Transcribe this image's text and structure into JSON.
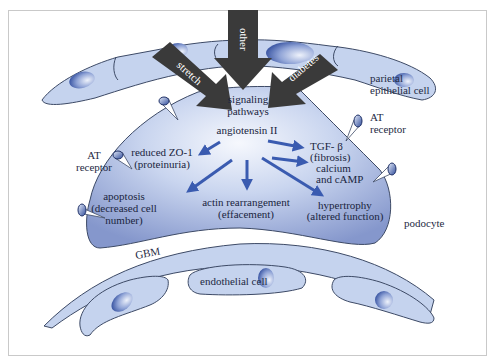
{
  "diagram": {
    "type": "biological-pathway-schematic",
    "colors": {
      "cell_fill": "#c5d3ee",
      "cell_stroke": "#3d4a66",
      "podocyte_center": "#f4f7fd",
      "podocyte_edge": "#8ea3d4",
      "input_arrow": "#3a3a3a",
      "effect_arrow": "#3a5bb0",
      "text": "#1e2a44"
    },
    "inputs": [
      {
        "label": "stretch"
      },
      {
        "label": "other"
      },
      {
        "label": "diabetes"
      }
    ],
    "cells": {
      "parietal": {
        "line1": "parietal",
        "line2": "epithelial cell"
      },
      "podocyte": {
        "label": "podocyte"
      },
      "gbm": {
        "label": "GBM"
      },
      "endothelial": {
        "label": "endothelial cell"
      }
    },
    "receptors": {
      "left": {
        "line1": "AT",
        "line2": "receptor"
      },
      "right": {
        "line1": "AT",
        "line2": "receptor"
      }
    },
    "center": {
      "signaling_line1": "signaling",
      "signaling_line2": "pathways",
      "mediator": "angiotensin II"
    },
    "effects": [
      {
        "line1": "reduced ZO-1",
        "line2": "(proteinuria)"
      },
      {
        "line1": "apoptosis",
        "line2": "(decreased cell",
        "line3": "number)"
      },
      {
        "line1": "actin rearrangement",
        "line2": "(effacement)"
      },
      {
        "line1": "hypertrophy",
        "line2": "(altered function)"
      },
      {
        "line1": "TGF- β",
        "line2": "(fibrosis)"
      },
      {
        "line1": "calcium",
        "line2": "and cAMP"
      }
    ]
  }
}
